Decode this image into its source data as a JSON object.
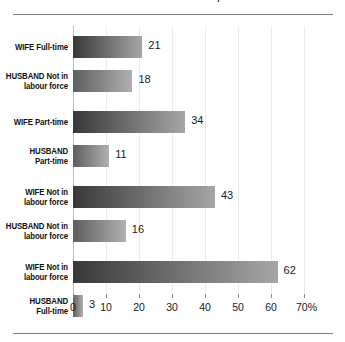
{
  "chart_data": {
    "type": "bar",
    "orientation": "horizontal",
    "title": "Labour Force Status, 1996",
    "xlabel": "",
    "ylabel": "",
    "xlim": [
      0,
      70
    ],
    "xticks": [
      0,
      10,
      20,
      30,
      40,
      50,
      60,
      70
    ],
    "xtick_labels": [
      "0",
      "10",
      "20",
      "30",
      "40",
      "50",
      "60",
      "70%"
    ],
    "grid": true,
    "legend": "none",
    "value_label_suffix": "",
    "categories": [
      "WIFE Full-time",
      "HUSBAND Not in labour force",
      "WIFE Part-time",
      "HUSBAND Part-time",
      "WIFE Not in labour force",
      "HUSBAND Not in labour force",
      "WIFE Not in labour force",
      "HUSBAND Full-time"
    ],
    "category_lines": [
      [
        "WIFE Full-time"
      ],
      [
        "HUSBAND Not in",
        "labour force"
      ],
      [
        "WIFE Part-time"
      ],
      [
        "HUSBAND",
        "Part-time"
      ],
      [
        "WIFE Not in",
        "labour force"
      ],
      [
        "HUSBAND Not in",
        "labour force"
      ],
      [
        "WIFE Not in",
        "labour force"
      ],
      [
        "HUSBAND",
        "Full-time"
      ]
    ],
    "values": [
      21,
      18,
      34,
      11,
      43,
      16,
      62,
      3
    ],
    "value_labels": [
      "21",
      "18",
      "34",
      "11",
      "43",
      "16",
      "62",
      "3"
    ],
    "colors": {
      "bar_gradient_start": "#383838",
      "bar_gradient_end": "#a6a6a6",
      "bar_gradient_start_alt": "#5e5e5e",
      "bar_gradient_end_alt": "#b0b0b0",
      "gridline": "#ececec",
      "rule": "#7d7d7d",
      "text": "#1a1a1a",
      "background": "#ffffff"
    }
  }
}
